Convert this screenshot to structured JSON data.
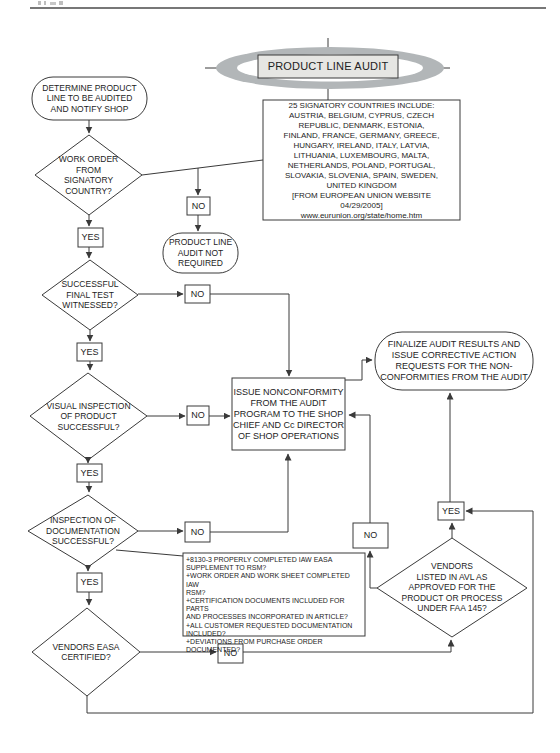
{
  "title": "PRODUCT LINE AUDIT",
  "decision_labels": {
    "yes": "YES",
    "no": "NO"
  },
  "nodes": {
    "determine": "DETERMINE PRODUCT\nLINE TO BE AUDITED\nAND NOTIFY SHOP",
    "work_order": "WORK ORDER\nFROM\nSIGNATORY\nCOUNTRY?",
    "countries_note": "25 SIGNATORY COUNTRIES INCLUDE:\nAUSTRIA, BELGIUM, CYPRUS, CZECH\nREPUBLIC, DENMARK, ESTONIA,\nFINLAND, FRANCE, GERMANY, GREECE,\nHUNGARY, IRELAND, ITALY, LATVIA,\nLITHUANIA, LUXEMBOURG, MALTA,\nNETHERLANDS, POLAND, PORTUGAL,\nSLOVAKIA, SLOVENIA, SPAIN, SWEDEN,\nUNITED KINGDOM\n[FROM EUROPEAN UNION WEBSITE\n04/29/2005]\nwww.eurunion.org/state/home.htm",
    "audit_not_required": "PRODUCT LINE\nAUDIT NOT\nREQUIRED",
    "final_test": "SUCCESSFUL\nFINAL TEST\nWITNESSED?",
    "visual_inspection": "VISUAL INSPECTION\nOF PRODUCT\nSUCCESSFUL?",
    "issue_nonconformity": "ISSUE NONCONFORMITY\nFROM THE AUDIT\nPROGRAM TO THE SHOP\nCHIEF AND Cc DIRECTOR\nOF SHOP OPERATIONS",
    "finalize": "FINALIZE AUDIT RESULTS AND\nISSUE CORRECTIVE ACTION\nREQUESTS FOR THE NON-\nCONFORMITIES FROM THE AUDIT",
    "doc_inspection": "INSPECTION OF\nDOCUMENTATION\nSUCCESSFUL?",
    "doc_checklist": "+8130-3 PROPERLY COMPLETED IAW EASA\nSUPPLEMENT TO RSM?\n+WORK ORDER AND WORK SHEET COMPLETED IAW\nRSM?\n+CERTIFICATION DOCUMENTS INCLUDED FOR PARTS\nAND PROCESSES INCORPORATED IN ARTICLE?\n+ALL CUSTOMER REQUESTED DOCUMENTATION\nINCLUDED?\n+DEVIATIONS FROM PURCHASE ORDER\nDOCUMENTED?",
    "vendors_easa": "VENDORS EASA\nCERTIFIED?",
    "vendors_avl": "VENDORS\nLISTED IN AVL AS\nAPPROVED FOR THE\nPRODUCT OR PROCESS\nUNDER FAA 145?"
  },
  "colors": {
    "line": "#3a3a3a",
    "title_ring_gray": "#b2b6b8",
    "title_box_fill": "#e6e6e3",
    "background": "#ffffff"
  }
}
